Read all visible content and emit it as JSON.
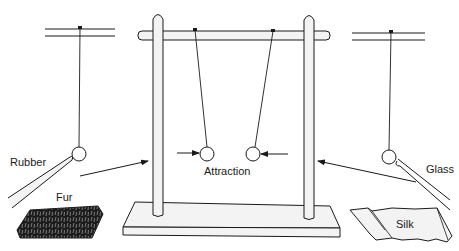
{
  "diagram": {
    "colors": {
      "ink": "#1a1a1a",
      "fill_light": "#f2f2f2",
      "fur": "#1c1c1c",
      "background": "#ffffff"
    },
    "labels": {
      "rubber": "Rubber",
      "fur": "Fur",
      "attraction": "Attraction",
      "glass": "Glass",
      "silk": "Silk"
    },
    "elements": [
      {
        "id": "left-suspension",
        "type": "suspended-ball",
        "note": "ball charged by rubber rod"
      },
      {
        "id": "rubber-rod",
        "type": "rod",
        "label": "Rubber"
      },
      {
        "id": "fur-cloth",
        "type": "material",
        "label": "Fur"
      },
      {
        "id": "stand-frame",
        "type": "stand",
        "parts": [
          "left-post",
          "right-post",
          "crossbar",
          "base"
        ]
      },
      {
        "id": "pendulum-left",
        "type": "pith-ball"
      },
      {
        "id": "pendulum-right",
        "type": "pith-ball"
      },
      {
        "id": "right-suspension",
        "type": "suspended-ball",
        "note": "ball charged by glass rod"
      },
      {
        "id": "glass-rod",
        "type": "rod",
        "label": "Glass"
      },
      {
        "id": "silk-cloth",
        "type": "material",
        "label": "Silk"
      }
    ],
    "arrows": [
      {
        "from": "left-suspension",
        "to": "pendulum-left",
        "meaning": "transfer"
      },
      {
        "from": "right-suspension",
        "to": "pendulum-right",
        "meaning": "transfer"
      },
      {
        "at": "pendulum-left",
        "direction": "right",
        "meaning": "attraction force"
      },
      {
        "at": "pendulum-right",
        "direction": "left",
        "meaning": "attraction force"
      }
    ]
  }
}
